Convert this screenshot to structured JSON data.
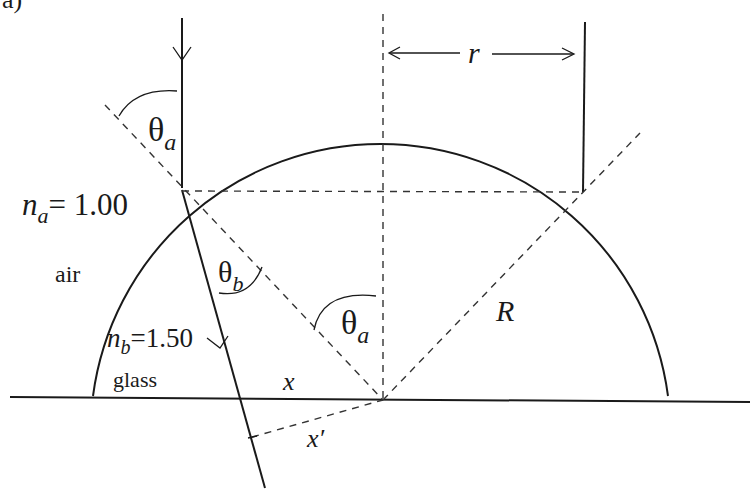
{
  "figure": {
    "panel_label": "a)",
    "labels": {
      "theta_a_top": {
        "symbol": "θ",
        "sub": "a"
      },
      "theta_b": {
        "symbol": "θ",
        "sub": "b"
      },
      "theta_a_center": {
        "symbol": "θ",
        "sub": "a"
      },
      "n_a": {
        "symbol": "n",
        "sub": "a",
        "value": "= 1.00"
      },
      "air": "air",
      "n_b": {
        "symbol": "n",
        "sub": "b",
        "value": "=1.50"
      },
      "glass": "glass",
      "x": "x",
      "x_prime": "x′",
      "r": "r",
      "R": "R"
    },
    "colors": {
      "line": "#1a1a1a",
      "dashed": "#333333",
      "background": "#ffffff"
    }
  }
}
